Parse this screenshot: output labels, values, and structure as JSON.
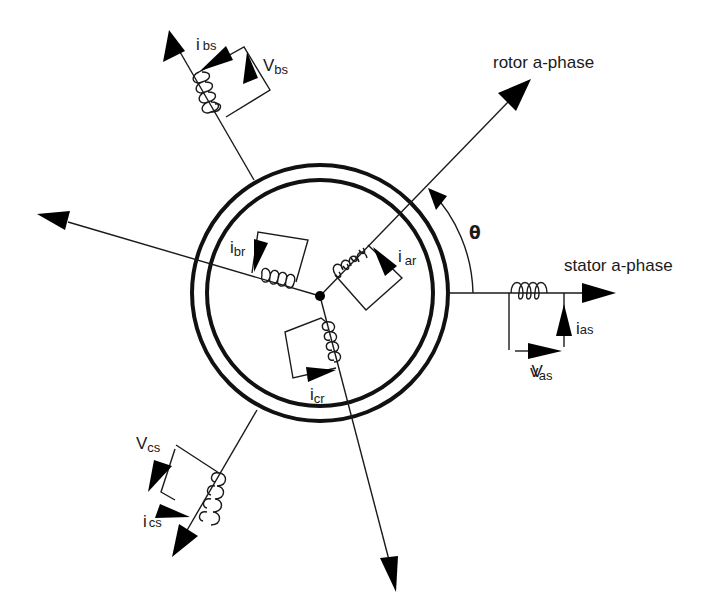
{
  "diagram": {
    "axes": {
      "rotor_a_phase": "rotor a-phase",
      "stator_a_phase": "stator a-phase",
      "angle": "θ"
    },
    "stator_windings": [
      {
        "phase": "a",
        "current": {
          "base": "i",
          "sub": "as"
        },
        "voltage": {
          "base": "v",
          "sub": "as",
          "overlay": "V"
        }
      },
      {
        "phase": "b",
        "current": {
          "base": "i",
          "sub": "bs"
        },
        "voltage": {
          "base": "V",
          "sub": "bs"
        }
      },
      {
        "phase": "c",
        "current": {
          "base": "i",
          "sub": "cs"
        },
        "voltage": {
          "base": "V",
          "sub": "cs"
        }
      }
    ],
    "rotor_windings": [
      {
        "phase": "a",
        "current": {
          "base": "i",
          "sub": "ar"
        }
      },
      {
        "phase": "b",
        "current": {
          "base": "i",
          "sub": "br"
        }
      },
      {
        "phase": "c",
        "current": {
          "base": "i",
          "sub": "cr"
        }
      }
    ],
    "colors": {
      "ink": "#1a1a1a",
      "background": "#ffffff"
    }
  }
}
